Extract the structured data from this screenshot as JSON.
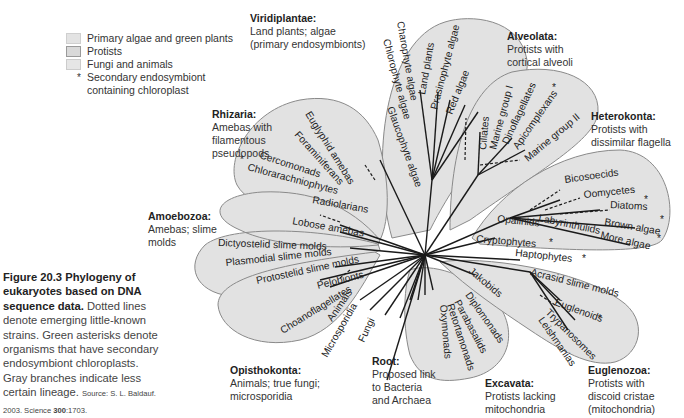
{
  "legend": {
    "items": [
      {
        "label": "Primary algae and green plants",
        "swatch": "plants"
      },
      {
        "label": "Protists",
        "swatch": "protists"
      },
      {
        "label": "Fungi and animals",
        "swatch": "fungi"
      }
    ],
    "star_symbol": "*",
    "star_label_1": "Secondary endosymbiont",
    "star_label_2": "containing chloroplast"
  },
  "groups": {
    "viridiplantae": {
      "name": "Viridiplantae:",
      "desc_1": "Land plants; algae",
      "desc_2": "(primary endosymbionts)"
    },
    "alveolata": {
      "name": "Alveolata:",
      "desc_1": "Protists with",
      "desc_2": "cortical alveoli"
    },
    "heterokonta": {
      "name": "Heterokonta:",
      "desc_1": "Protists with",
      "desc_2": "dissimilar flagella"
    },
    "rhizaria": {
      "name": "Rhizaria:",
      "desc_1": "Amebas with",
      "desc_2": "filamentous",
      "desc_3": "pseudopods"
    },
    "amoebozoa": {
      "name": "Amoebozoa:",
      "desc_1": "Amebas; slime",
      "desc_2": "molds"
    },
    "opisthokonta": {
      "name": "Opisthokonta:",
      "desc_1": "Animals; true fungi;",
      "desc_2": "microsporidia"
    },
    "root": {
      "name": "Root:",
      "desc_1": "Proposed link",
      "desc_2": "to Bacteria",
      "desc_3": "and Archaea"
    },
    "excavata": {
      "name": "Excavata:",
      "desc_1": "Protists lacking",
      "desc_2": "mitochondria"
    },
    "euglenozoa": {
      "name": "Euglenozoa:",
      "desc_1": "Protists with",
      "desc_2": "discoid cristae",
      "desc_3": "(mitochondria)"
    }
  },
  "taxa": {
    "viridiplantae": [
      "Charophyte algae",
      "Chlorophyte algae",
      "Land plants",
      "Prasinophyte algae",
      "Red algae",
      "Glaucophyte algae"
    ],
    "alveolata": [
      "Ciliates",
      "Marine group I",
      "Dinoflagellates",
      "Apicomplexans",
      "Marine group II"
    ],
    "heterokonta": [
      "Bicosoecids",
      "Oomycetes",
      "Diatoms",
      "Brown algae",
      "More algae",
      "Opalinids",
      "Labyrinthulids"
    ],
    "other": [
      "Cryptophytes",
      "Haptophytes"
    ],
    "rhizaria": [
      "Euglyphid amebas",
      "Foraminiferans",
      "Cercomonads",
      "Chlorarachniophytes",
      "Radiolarians"
    ],
    "amoebozoa": [
      "Lobose amebas",
      "Dictyostelid slime molds",
      "Plasmodial slime molds",
      "Protostelid slime molds",
      "Pelobionts"
    ],
    "opisthokonta": [
      "Choanoflagellates",
      "Animals",
      "Microsporidia",
      "Fungi"
    ],
    "excavata": [
      "Jakobids",
      "Diplomonads",
      "Parabasalids",
      "Retortamonads",
      "Oxymonads"
    ],
    "euglenozoa": [
      "Acrasid slime molds",
      "Euglenoids",
      "Trypanosomes",
      "Leishmanias"
    ]
  },
  "stars": {
    "symbol": "*"
  },
  "caption": {
    "title": "Figure 20.3   Phylogeny of eukaryotes based on DNA sequence data.",
    "body": "Dotted lines denote emerging little-known strains. Green asterisks denote organisms that have secondary endosymbiont chloroplasts. Gray branches indicate less certain lineage.",
    "source_prefix": "Source: S. L. Baldauf. 2003. Science ",
    "source_volume": "300",
    "source_suffix": ":1703."
  },
  "colors": {
    "clade_fill": "#e2e2e2",
    "clade_stroke": "#8a8a8a",
    "branch": "#1a1a1a",
    "star": "#555555"
  }
}
